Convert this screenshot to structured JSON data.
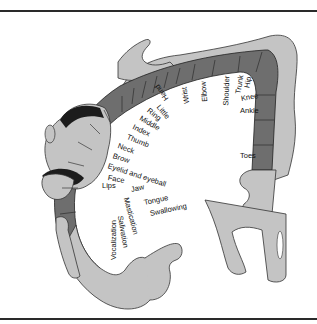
{
  "figure": {
    "colors": {
      "cortex_dark": "#6e6e6e",
      "body_fill": "#c4c4c4",
      "outline": "#333333",
      "background": "#ffffff"
    },
    "labels": {
      "toes": "Toes",
      "ankle": "Ankle",
      "knee": "Knee",
      "hip": "Hip",
      "trunk": "Trunk",
      "shoulder": "Shoulder",
      "elbow": "Elbow",
      "wrist": "Wrist",
      "hand": "Hand",
      "little": "Little",
      "ring": "Ring",
      "middle": "Middle",
      "index": "Index",
      "thumb": "Thumb",
      "neck": "Neck",
      "brow": "Brow",
      "eyelid": "Eyelid and eyeball",
      "face": "Face",
      "lips": "Lips",
      "jaw": "Jaw",
      "tongue": "Tongue",
      "swallowing": "Swallowing",
      "mastication": "Mastication",
      "salivation": "Salivation",
      "vocalization": "Vocalization"
    }
  }
}
